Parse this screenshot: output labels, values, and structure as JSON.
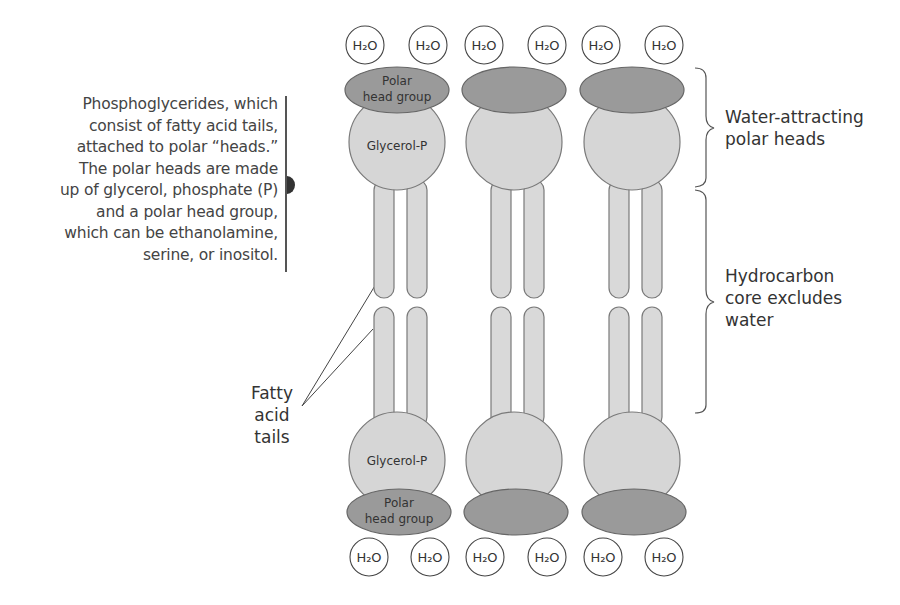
{
  "caption": {
    "lines": [
      "Phosphoglycerides, which",
      "consist of fatty acid tails,",
      "attached to polar “heads.”",
      "The polar heads are made",
      "up of glycerol, phosphate (P)",
      "and a polar head group,",
      "which can be ethanolamine,",
      "serine, or inositol."
    ]
  },
  "labels": {
    "water_attracting": [
      "Water-attracting",
      "polar heads"
    ],
    "hydrocarbon_core": [
      "Hydrocarbon",
      "core excludes",
      "water"
    ],
    "fatty_acid_tails": [
      "Fatty",
      "acid",
      "tails"
    ],
    "polar_head_group": [
      "Polar",
      "head group"
    ],
    "glycerol_p": "Glycerol-P",
    "water_molecule": "H₂O"
  },
  "colors": {
    "head_group_fill": "#9a9a9a",
    "glycerol_fill": "#d6d6d6",
    "tail_fill": "#d9d9d9",
    "outline": "#7a7a7a",
    "water_outline": "#444444"
  },
  "layout": {
    "columns": [
      397,
      514,
      632
    ],
    "top_water_x": [
      365,
      428,
      484,
      547,
      601,
      664
    ],
    "bottom_water_x": [
      369,
      430,
      485,
      547,
      603,
      664
    ]
  }
}
